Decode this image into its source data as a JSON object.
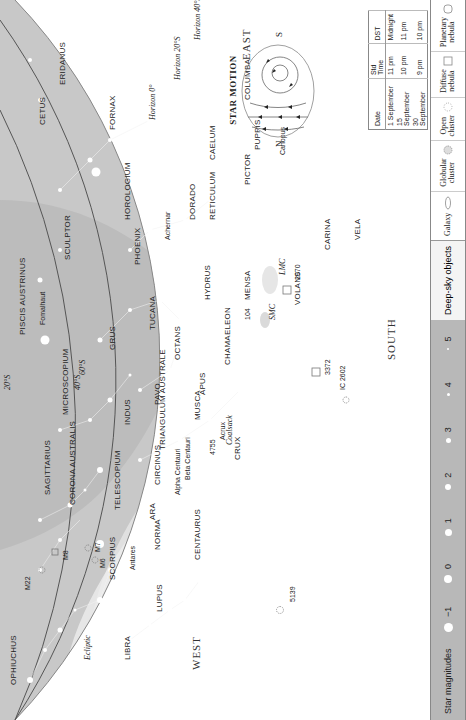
{
  "page": {
    "orientation": "rotated-90-ccw",
    "running_head": ""
  },
  "map": {
    "background_color": "#c8c8c8",
    "milky_way_color": "#e8e8e8",
    "horizons": [
      {
        "label": "Horizon 0°"
      },
      {
        "label": "Horizon 20°S"
      },
      {
        "label": "Horizon 40°S"
      }
    ],
    "latitude_labels": [
      "20°S",
      "40°S",
      "60°S"
    ],
    "directions": {
      "west": "WEST",
      "east": "EAST",
      "south": "SOUTH"
    },
    "ecliptic_label": "Ecliptic",
    "constellations": [
      "OPHIUCHUS",
      "LIBRA",
      "SCORPIUS",
      "LUPUS",
      "CENTAURUS",
      "NORMA",
      "ARA",
      "CIRCINUS",
      "SAGITTARIUS",
      "CORONA AUSTRALIS",
      "TELESCOPIUM",
      "TRIANGULUM AUSTRALE",
      "MUSCA",
      "CRUX",
      "MICROSCOPIUM",
      "INDUS",
      "PAVO",
      "APUS",
      "OCTANS",
      "CHAMAELEON",
      "PISCIS AUSTRINUS",
      "GRUS",
      "TUCANA",
      "HYDRUS",
      "MENSA",
      "VOLANS",
      "CARINA",
      "VELA",
      "SCULPTOR",
      "PHOENIX",
      "HOROLOGIUM",
      "DORADO",
      "RETICULUM",
      "PICTOR",
      "PUPPIS",
      "CETUS",
      "FORNAX",
      "CAELUM",
      "ERIDANUS",
      "COLUMBA"
    ],
    "stars": [
      "Antares",
      "Alpha Centauri",
      "Beta Centauri",
      "Acrux",
      "Fomalhaut",
      "Achernar",
      "Canopus"
    ],
    "deep_sky": [
      "M22",
      "M8",
      "M7",
      "M6",
      "5139",
      "4755",
      "IC 2602",
      "3372",
      "104",
      "SMC",
      "LMC",
      "2070",
      "Coalsack"
    ]
  },
  "star_motion": {
    "title": "Star motion",
    "left": "N",
    "right": "S"
  },
  "time_table": {
    "headers": [
      "Date",
      "Std Time",
      "DST"
    ],
    "rows": [
      [
        "1 September",
        "11 pm",
        "Midnight"
      ],
      [
        "15 September",
        "10 pm",
        "11 pm"
      ],
      [
        "30 September",
        "9 pm",
        "10 pm"
      ]
    ]
  },
  "legend": {
    "magnitudes_title": "Star magnitudes",
    "magnitudes": [
      "−1",
      "0",
      "1",
      "2",
      "3",
      "4",
      "5"
    ],
    "deep_sky_title": "Deep-sky objects",
    "deep_sky_types": [
      {
        "label": "Galaxy",
        "icon": "ellipse-icon"
      },
      {
        "label": "Globular\ncluster",
        "icon": "dotted-circle-icon"
      },
      {
        "label": "Open\ncluster",
        "icon": "dot-cluster-icon"
      },
      {
        "label": "Diffuse\nnebula",
        "icon": "square-icon"
      },
      {
        "label": "Planetary\nnebula",
        "icon": "rounded-square-icon"
      }
    ]
  }
}
